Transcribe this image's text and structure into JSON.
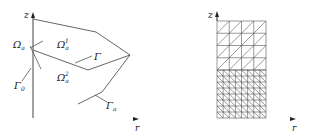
{
  "left_panel": {
    "axis_labels": {
      "vertical": "z",
      "horizontal": "r"
    },
    "regions": [
      {
        "symbol": "Ω",
        "sub": "a",
        "sup": "1"
      },
      {
        "symbol": "Ω",
        "sub": "a",
        "sup": "2"
      },
      {
        "symbol": "Ω",
        "sub": "a",
        "sup": ""
      }
    ],
    "boundaries": [
      {
        "symbol": "Γ",
        "sub": ""
      },
      {
        "symbol": "Γ",
        "sub": "a"
      },
      {
        "symbol": "Γ",
        "sub": "0"
      }
    ]
  },
  "right_panel": {
    "axis_labels": {
      "vertical": "z",
      "horizontal": "r"
    },
    "mesh": {
      "coarse": {
        "columns": 4,
        "rows": 4,
        "diagonal": "bottom-left to top-right"
      },
      "fine": {
        "columns": 8,
        "rows": 8,
        "diagonal": "top-left to bottom-right"
      }
    }
  },
  "colors": {
    "line": "#555555",
    "axis": "#222222",
    "background": "#ffffff"
  }
}
